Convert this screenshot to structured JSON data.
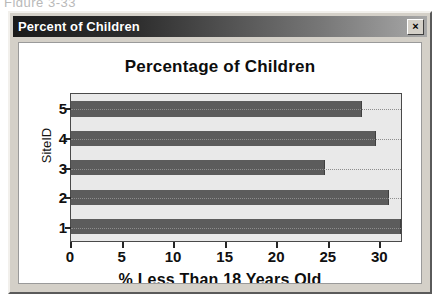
{
  "scan_caption": "Figure 3-33",
  "window": {
    "title": "Percent of Children",
    "close_label": "×"
  },
  "chart_data": {
    "type": "bar",
    "orientation": "horizontal",
    "title": "Percentage of Children",
    "xlabel": "% Less Than 18 Years Old",
    "ylabel": "SiteID",
    "categories": [
      "1",
      "2",
      "3",
      "4",
      "5"
    ],
    "values": [
      32.2,
      31.0,
      24.8,
      29.8,
      28.4
    ],
    "xlim": [
      0,
      32.2
    ],
    "xticks": [
      0,
      5,
      10,
      15,
      20,
      25,
      30
    ],
    "xticklabels": [
      "0",
      "5",
      "10",
      "15",
      "20",
      "25",
      "30"
    ],
    "yticklabels": [
      "1",
      "2",
      "3",
      "4",
      "5"
    ],
    "grid": true,
    "grid_axis": "y",
    "legend": null,
    "bar_color": "#5c5c5c",
    "plot_bgcolor": "#e9e9e9"
  }
}
